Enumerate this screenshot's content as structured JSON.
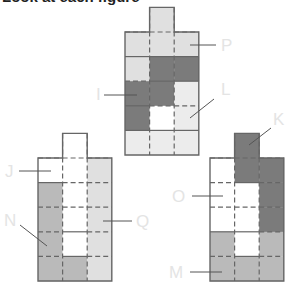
{
  "heading": "Look at each figure",
  "colors": {
    "dark": "#7b7b7b",
    "mid": "#bababa",
    "light": "#e0e0e0",
    "lighter": "#ececec",
    "white": "#ffffff",
    "border": "#666666",
    "label": "#e4e4e4",
    "leader": "#555555"
  },
  "cell_size": 24.6,
  "figures": [
    {
      "name": "figure-top",
      "x": 125,
      "y": 32,
      "tab": {
        "col": 1,
        "fill": "light"
      },
      "rows": [
        [
          "light",
          "light",
          "light"
        ],
        [
          "light",
          "dark",
          "dark"
        ],
        [
          "dark",
          "dark",
          "lighter"
        ],
        [
          "dark",
          "white",
          "lighter"
        ],
        [
          "lighter",
          "lighter",
          "lighter"
        ]
      ],
      "solid_h": [
        [
          1,
          0
        ],
        [
          1,
          1
        ],
        [
          1,
          2
        ],
        [
          2,
          1
        ],
        [
          2,
          2
        ],
        [
          3,
          0
        ],
        [
          4,
          0
        ],
        [
          4,
          1
        ],
        [
          4,
          2
        ]
      ],
      "labels": [
        {
          "text": "P",
          "lx": 221,
          "ly": 37,
          "line": [
            190,
            45,
            216,
            45
          ]
        },
        {
          "text": "L",
          "lx": 221,
          "ly": 81,
          "line": [
            214,
            99,
            190,
            118
          ]
        },
        {
          "text": "I",
          "lx": 96,
          "ly": 86,
          "line": [
            104,
            95,
            137,
            95
          ]
        }
      ]
    },
    {
      "name": "figure-bottom-left",
      "x": 38,
      "y": 158,
      "tab": {
        "col": 1,
        "fill": "white"
      },
      "rows": [
        [
          "white",
          "white",
          "light"
        ],
        [
          "mid",
          "white",
          "light"
        ],
        [
          "mid",
          "white",
          "light"
        ],
        [
          "mid",
          "white",
          "light"
        ],
        [
          "mid",
          "mid",
          "light"
        ]
      ],
      "solid_h": [
        [
          1,
          0
        ],
        [
          3,
          1
        ],
        [
          4,
          1
        ]
      ],
      "labels": [
        {
          "text": "J",
          "lx": 5,
          "ly": 163,
          "line": [
            19,
            171,
            51,
            171
          ]
        },
        {
          "text": "N",
          "lx": 4,
          "ly": 212,
          "line": [
            20,
            225,
            47,
            246
          ]
        },
        {
          "text": "Q",
          "lx": 136,
          "ly": 213,
          "line": [
            103,
            221,
            132,
            221
          ]
        }
      ]
    },
    {
      "name": "figure-bottom-right",
      "x": 210,
      "y": 158,
      "tab": {
        "col": 1,
        "fill": "dark"
      },
      "rows": [
        [
          "white",
          "dark",
          "dark"
        ],
        [
          "white",
          "white",
          "dark"
        ],
        [
          "white",
          "white",
          "dark"
        ],
        [
          "mid",
          "white",
          "mid"
        ],
        [
          "mid",
          "mid",
          "mid"
        ]
      ],
      "solid_h": [
        [
          1,
          1
        ],
        [
          3,
          0
        ],
        [
          3,
          1
        ],
        [
          4,
          1
        ]
      ],
      "labels": [
        {
          "text": "K",
          "lx": 273,
          "ly": 111,
          "line": [
            271,
            128,
            249,
            145
          ]
        },
        {
          "text": "O",
          "lx": 172,
          "ly": 188,
          "line": [
            192,
            196,
            223,
            196
          ]
        },
        {
          "text": "M",
          "lx": 169,
          "ly": 264,
          "line": [
            190,
            272,
            222,
            272
          ]
        }
      ]
    }
  ]
}
